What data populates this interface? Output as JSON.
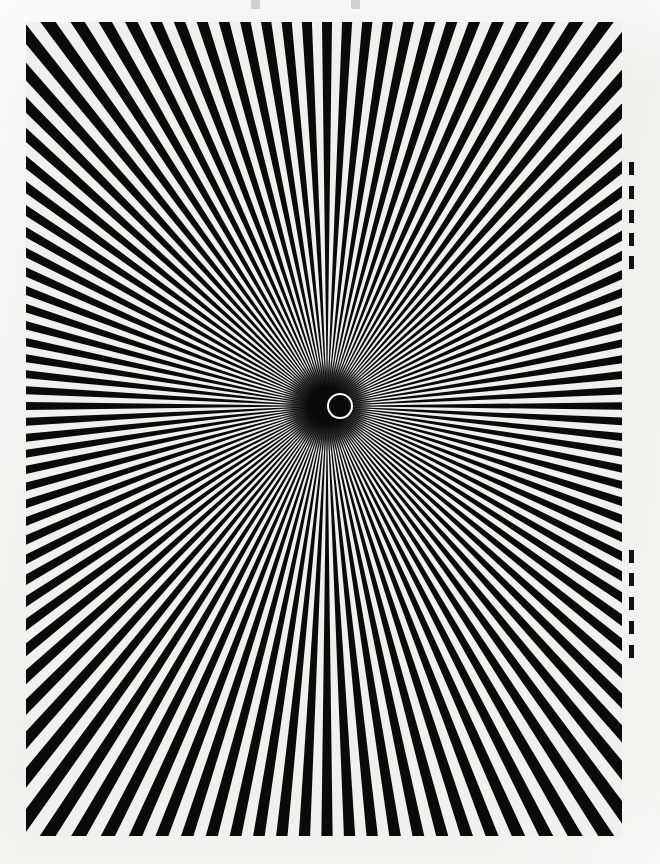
{
  "artwork": {
    "title": "Radial Starburst Optical Illusion",
    "medium": "High-contrast printed plate on off-white paper",
    "caption": "Black and white radiating ray figure with a small white circle outline at the convergence point"
  },
  "page": {
    "width": 660,
    "height": 864,
    "paper_color": "#f1efeb",
    "ink_color": "#0a0a0a",
    "highlight_color": "#ffffff"
  },
  "plate": {
    "left": 26,
    "top": 22,
    "width": 596,
    "height": 814,
    "background_color": "#0a0a0a"
  },
  "centre_ring": {
    "label": "centre-ring",
    "center_x": 327,
    "center_y": 406,
    "outer_diameter": 26,
    "stroke_width": 2.5,
    "stroke_color": "#ffffff"
  },
  "chart_data": {
    "type": "pie",
    "subtitle": "",
    "xlabel": "",
    "ylabel": "",
    "ray_count": 120,
    "duty_cycle": 0.5,
    "center": [
      327,
      406
    ],
    "ray_length": 1100,
    "start_angle_deg": 0,
    "sweep_deg": 360,
    "categories": [],
    "values": [],
    "legend_position": "none",
    "grid": false,
    "colors": {
      "ray": "#0a0a0a",
      "gap": "#f2f0ec"
    }
  },
  "registration_marks": {
    "label": "registration-dashes",
    "x": 629,
    "cluster_a": [
      162,
      186,
      210,
      233,
      256
    ],
    "cluster_b": [
      550,
      573,
      597,
      621,
      645
    ]
  },
  "top_artifacts": {
    "label": "scan-artifacts",
    "positions": [
      251,
      351
    ]
  }
}
